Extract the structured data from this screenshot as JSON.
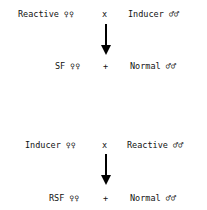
{
  "cross1": {
    "female_parent": "Reactive ♀♀",
    "cross_symbol": "x",
    "male_parent": "Inducer ♂♂",
    "female_offspring": "SF ♀♀",
    "plus_symbol": "+",
    "male_offspring": "Normal ♂♂"
  },
  "cross2": {
    "female_parent": "Inducer ♀♀",
    "cross_symbol": "x",
    "male_parent": "Reactive ♂♂",
    "female_offspring": "RSF ♀♀",
    "plus_symbol": "+",
    "male_offspring": "Normal ♂♂"
  }
}
